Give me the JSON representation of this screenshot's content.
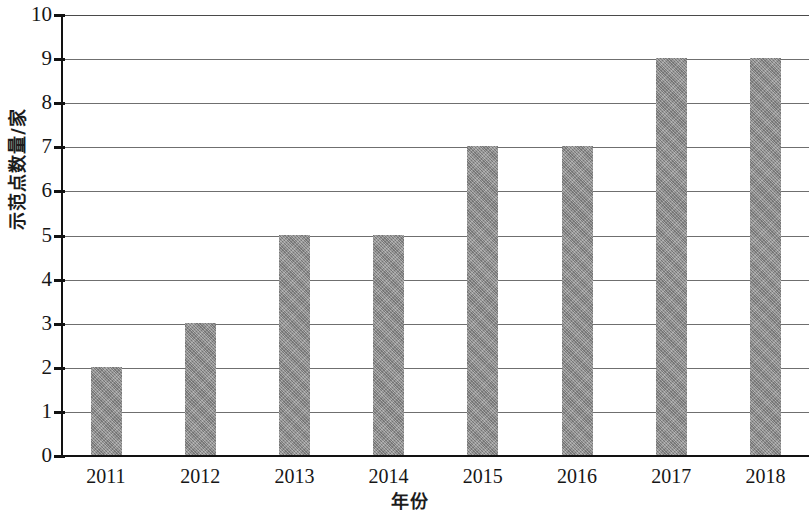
{
  "chart_data": {
    "type": "bar",
    "title": "",
    "xlabel": "年份",
    "ylabel": "示范点数量/家",
    "categories": [
      "2011",
      "2012",
      "2013",
      "2014",
      "2015",
      "2016",
      "2017",
      "2018"
    ],
    "values": [
      2,
      3,
      5,
      5,
      7,
      7,
      9,
      9
    ],
    "series": [
      {
        "name": "示范点数量",
        "values": [
          2,
          3,
          5,
          5,
          7,
          7,
          9,
          9
        ]
      }
    ],
    "ylim": [
      0,
      10
    ],
    "y_ticks": [
      "0",
      "1",
      "2",
      "3",
      "4",
      "5",
      "6",
      "7",
      "8",
      "9",
      "10"
    ],
    "y_tick_values": [
      0,
      1,
      2,
      3,
      4,
      5,
      6,
      7,
      8,
      9,
      10
    ],
    "grid": "horizontal",
    "legend": "none",
    "bar_color": "#8d8d8d",
    "bar_pattern": "diagonal-crosshatch",
    "axis_color": "#121212",
    "gridline_color": "#6f6f6f",
    "background": "#ffffff"
  }
}
